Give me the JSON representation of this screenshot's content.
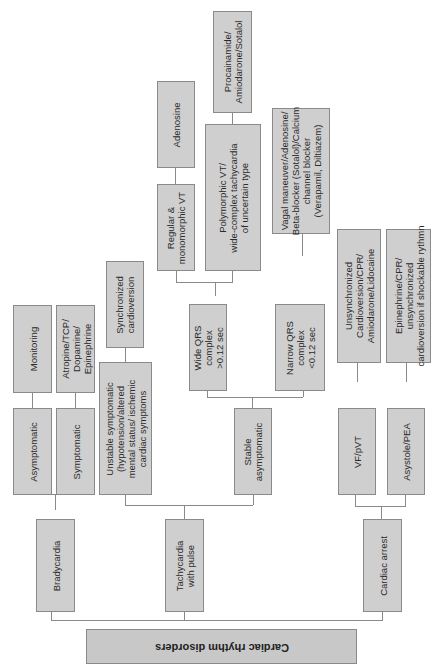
{
  "diagram": {
    "title": "Cardiac rhythm disorders",
    "orientation": "rotated-90-counterclockwise",
    "nodes": {
      "root": "Cardiac rhythm disorders",
      "bradycardia": "Bradycardia",
      "tachycardia": "Tachycardia\nwith pulse",
      "arrest": "Cardiac arrest",
      "asymptomatic": "Asymptomatic",
      "symptomatic": "Symptomatic",
      "monitoring": "Monitoring",
      "atropine": "Atropine/TCP/\nDopamine/\nEpinephrine",
      "unstable": "Unstable symptomatic\n(hypotension/altered\nmental status/ ischemic\ncardiac symptoms",
      "synchronized": "Synchronized\ncardioversion",
      "stable": "Stable\nasymptomatic",
      "wide_qrs": "Wide QRS\ncomplex\n>0.12 sec",
      "narrow_qrs": "Narrow QRS\ncomplex\n<0.12 sec",
      "regular_vt": "Regular &\nmonomorphic VT",
      "adenosine": "Adenosine",
      "polymorphic_vt": "Polymorphic VT/\nwide-complex tachycardia\nof uncertain type",
      "procainamide": "Procainamide/\nAmiodarone/Sotalol",
      "vagal": "Vagal maneuver/Adenosine/\nBeta-blocker (Sotalol)/Calcium\nchannel blocker\n(Verapamil, Diltiazem)",
      "vf_pvt": "VF/pVT",
      "asystole_pea": "Asystole/PEA",
      "unsync_cardioversion": "Unsynchronized\nCardioversion/CPR/\nAmiodarone/Lidocaine",
      "epinephrine_cpr": "Epinephrine/CPR/\nunsynchronized\ncardioversion if shockable rythmn"
    }
  }
}
